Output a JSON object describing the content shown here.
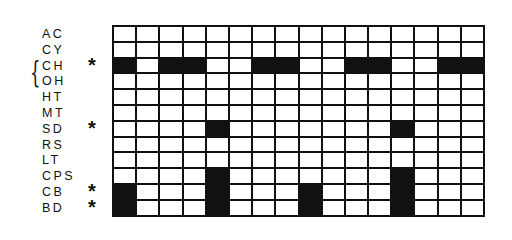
{
  "diagram": {
    "columns": 16,
    "rows": [
      {
        "label": "AC",
        "marked": false,
        "cells": [
          0,
          0,
          0,
          0,
          0,
          0,
          0,
          0,
          0,
          0,
          0,
          0,
          0,
          0,
          0,
          0
        ]
      },
      {
        "label": "CY",
        "marked": false,
        "cells": [
          0,
          0,
          0,
          0,
          0,
          0,
          0,
          0,
          0,
          0,
          0,
          0,
          0,
          0,
          0,
          0
        ]
      },
      {
        "label": "CH",
        "marked": true,
        "cells": [
          1,
          0,
          1,
          1,
          0,
          0,
          1,
          1,
          0,
          0,
          1,
          1,
          0,
          0,
          1,
          1
        ]
      },
      {
        "label": "OH",
        "marked": false,
        "cells": [
          0,
          0,
          0,
          0,
          0,
          0,
          0,
          0,
          0,
          0,
          0,
          0,
          0,
          0,
          0,
          0
        ]
      },
      {
        "label": "HT",
        "marked": false,
        "cells": [
          0,
          0,
          0,
          0,
          0,
          0,
          0,
          0,
          0,
          0,
          0,
          0,
          0,
          0,
          0,
          0
        ]
      },
      {
        "label": "MT",
        "marked": false,
        "cells": [
          0,
          0,
          0,
          0,
          0,
          0,
          0,
          0,
          0,
          0,
          0,
          0,
          0,
          0,
          0,
          0
        ]
      },
      {
        "label": "SD",
        "marked": true,
        "cells": [
          0,
          0,
          0,
          0,
          1,
          0,
          0,
          0,
          0,
          0,
          0,
          0,
          1,
          0,
          0,
          0
        ]
      },
      {
        "label": "RS",
        "marked": false,
        "cells": [
          0,
          0,
          0,
          0,
          0,
          0,
          0,
          0,
          0,
          0,
          0,
          0,
          0,
          0,
          0,
          0
        ]
      },
      {
        "label": "LT",
        "marked": false,
        "cells": [
          0,
          0,
          0,
          0,
          0,
          0,
          0,
          0,
          0,
          0,
          0,
          0,
          0,
          0,
          0,
          0
        ]
      },
      {
        "label": "CPS",
        "marked": false,
        "cells": [
          0,
          0,
          0,
          0,
          1,
          0,
          0,
          0,
          0,
          0,
          0,
          0,
          1,
          0,
          0,
          0
        ]
      },
      {
        "label": "CB",
        "marked": true,
        "cells": [
          1,
          0,
          0,
          0,
          1,
          0,
          0,
          0,
          1,
          0,
          0,
          0,
          1,
          0,
          0,
          0
        ]
      },
      {
        "label": "BD",
        "marked": true,
        "cells": [
          1,
          0,
          0,
          0,
          1,
          0,
          0,
          0,
          1,
          0,
          0,
          0,
          1,
          0,
          0,
          0
        ]
      }
    ],
    "marker_symbol": "*",
    "brace_symbol": "{",
    "brace_groups": [
      [
        "CH",
        "OH"
      ]
    ],
    "colors": {
      "filled": "#111111",
      "empty": "#ffffff",
      "line": "#111111"
    }
  }
}
